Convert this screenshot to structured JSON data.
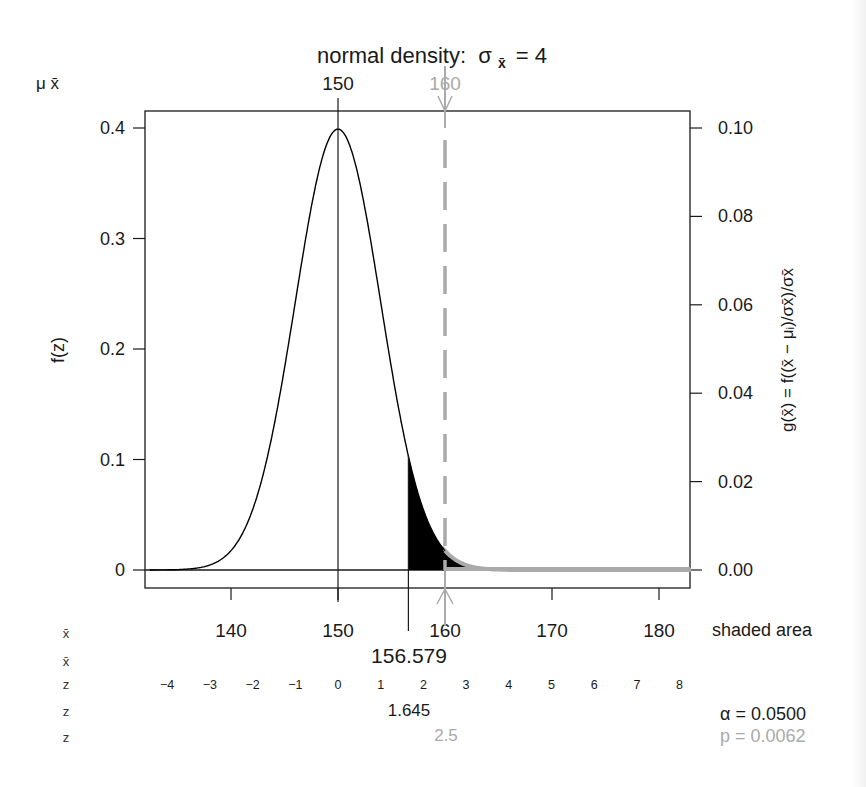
{
  "chart_data": {
    "type": "line",
    "title_main": "normal density:",
    "title_sigma": "σ",
    "title_sub": "x̄",
    "title_value": "= 4",
    "mu": 150,
    "sigma_xbar": 4,
    "xlim": [
      132,
      183
    ],
    "left_axis": {
      "label": "f(z)",
      "ticks": [
        0,
        0.1,
        0.2,
        0.3,
        0.4
      ],
      "tick_labels": [
        "0",
        "0.1",
        "0.2",
        "0.3",
        "0.4"
      ],
      "ylim": [
        -0.016,
        0.416
      ]
    },
    "right_axis": {
      "label": "g(x̄) = f((x̄ − μᵢ)/σx̄)/σx̄",
      "ticks": [
        0.0,
        0.02,
        0.04,
        0.06,
        0.08,
        0.1
      ],
      "tick_labels": [
        "0.00",
        "0.02",
        "0.04",
        "0.06",
        "0.08",
        "0.10"
      ]
    },
    "top_axis": {
      "row_label": "μ  x̄",
      "ticks": [
        150,
        160
      ],
      "tick_labels": [
        "150",
        "160"
      ],
      "tick_colors": [
        "#1a1a1a",
        "#aaaaaa"
      ]
    },
    "bottom_axis": {
      "ticks": [
        140,
        150,
        160,
        170,
        180
      ],
      "tick_labels": [
        "140",
        "150",
        "160",
        "170",
        "180"
      ],
      "right_label": "shaded area"
    },
    "margin_rows": [
      {
        "label": "x̄",
        "content": "140 150 160 170 180"
      },
      {
        "label": "x̄",
        "content": "156.579"
      },
      {
        "label": "z",
        "content": "-4 ... 8"
      },
      {
        "label": "z",
        "content": "1.645"
      },
      {
        "label": "z",
        "content": "2.5"
      }
    ],
    "critical_xbar": 156.579,
    "critical_xbar_label": "156.579",
    "z_ticks": [
      -4,
      -3,
      -2,
      -1,
      0,
      1,
      2,
      3,
      4,
      5,
      6,
      7,
      8
    ],
    "z_tick_labels": [
      "−4",
      "−3",
      "−2",
      "−1",
      "0",
      "1",
      "2",
      "3",
      "4",
      "5",
      "6",
      "7",
      "8"
    ],
    "critical_z": 1.645,
    "critical_z_label": "1.645",
    "observed_xbar": 160,
    "observed_z": 2.5,
    "observed_z_label": "2.5",
    "alpha_label": "α = 0.0500",
    "p_label": "p = 0.0062",
    "alpha": 0.05,
    "p_value": 0.0062,
    "shaded_region": {
      "from_xbar": 156.579,
      "to_xbar": 183,
      "color": "#000000"
    },
    "observed_tail": {
      "from_xbar": 160,
      "color": "#aaaaaa"
    },
    "colors": {
      "curve": "#000000",
      "observed": "#aaaaaa",
      "text": "#1a1a1a"
    }
  }
}
